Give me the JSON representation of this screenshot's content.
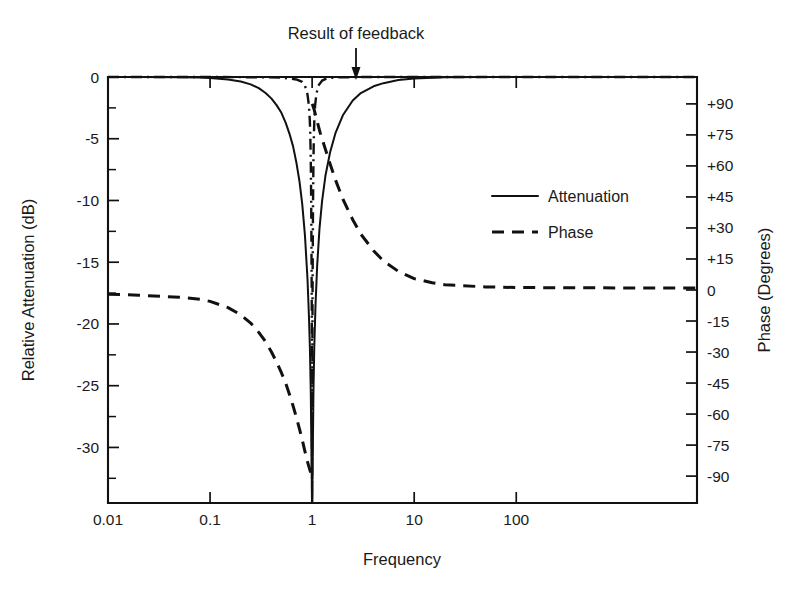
{
  "figure": {
    "annotation": {
      "text": "Result of feedback",
      "points_to": "dash-dot notch curve near f = 1"
    },
    "legend": {
      "entries": [
        {
          "label": "Attenuation",
          "style": "solid"
        },
        {
          "label": "Phase",
          "style": "dashed"
        }
      ]
    }
  },
  "chart_data": {
    "type": "line",
    "title": "",
    "xlabel": "Frequency",
    "ylabel": "Relative Attenuation (dB)",
    "y2label": "Phase (Degrees)",
    "xscale": "log",
    "xlim": [
      0.01,
      5900
    ],
    "ylim": [
      -34.5,
      0
    ],
    "y2lim": [
      -103,
      103
    ],
    "grid": false,
    "legend_position": "center-right",
    "xticks": [
      "0.01",
      "0.1",
      "1",
      "10",
      "100"
    ],
    "xtick_values": [
      0.01,
      0.1,
      1,
      10,
      100
    ],
    "yticks": [
      "0",
      "-5",
      "-10",
      "-15",
      "-20",
      "-25",
      "-30"
    ],
    "ytick_values": [
      0,
      -5,
      -10,
      -15,
      -20,
      -25,
      -30
    ],
    "yticks_minor": [
      -2.5,
      -7.5,
      -12.5,
      -17.5,
      -22.5,
      -27.5,
      -32.5
    ],
    "y2ticks": [
      "+90",
      "+75",
      "+60",
      "+45",
      "+30",
      "+15",
      "0",
      "-15",
      "-30",
      "-45",
      "-60",
      "-75",
      "-90"
    ],
    "y2tick_values": [
      90,
      75,
      60,
      45,
      30,
      15,
      0,
      -15,
      -30,
      -45,
      -60,
      -75,
      -90
    ],
    "series": [
      {
        "name": "Attenuation",
        "style": "solid",
        "axis": "left",
        "units": "dB",
        "description": "Notch filter response, null at f = 1, flat 0 dB far from the notch",
        "points": [
          [
            0.01,
            0.0
          ],
          [
            0.02,
            0.0
          ],
          [
            0.05,
            -0.02
          ],
          [
            0.08,
            -0.05
          ],
          [
            0.1,
            -0.09
          ],
          [
            0.15,
            -0.2
          ],
          [
            0.2,
            -0.37
          ],
          [
            0.25,
            -0.6
          ],
          [
            0.3,
            -0.9
          ],
          [
            0.35,
            -1.3
          ],
          [
            0.4,
            -1.75
          ],
          [
            0.45,
            -2.3
          ],
          [
            0.5,
            -2.9
          ],
          [
            0.55,
            -3.7
          ],
          [
            0.6,
            -4.6
          ],
          [
            0.65,
            -5.6
          ],
          [
            0.7,
            -6.9
          ],
          [
            0.75,
            -8.4
          ],
          [
            0.8,
            -10.3
          ],
          [
            0.85,
            -12.8
          ],
          [
            0.9,
            -16.3
          ],
          [
            0.93,
            -19.3
          ],
          [
            0.95,
            -21.8
          ],
          [
            0.97,
            -25.5
          ],
          [
            0.99,
            -32.0
          ],
          [
            1.0,
            -34.5
          ],
          [
            1.01,
            -32.0
          ],
          [
            1.03,
            -25.5
          ],
          [
            1.05,
            -21.8
          ],
          [
            1.08,
            -18.4
          ],
          [
            1.12,
            -15.3
          ],
          [
            1.18,
            -12.3
          ],
          [
            1.25,
            -10.1
          ],
          [
            1.35,
            -8.0
          ],
          [
            1.5,
            -6.1
          ],
          [
            1.7,
            -4.5
          ],
          [
            2.0,
            -3.1
          ],
          [
            2.5,
            -1.9
          ],
          [
            3.0,
            -1.3
          ],
          [
            4.0,
            -0.75
          ],
          [
            5.0,
            -0.5
          ],
          [
            7.0,
            -0.25
          ],
          [
            10,
            -0.12
          ],
          [
            20,
            -0.03
          ],
          [
            50,
            -0.01
          ],
          [
            100,
            0.0
          ],
          [
            1000,
            0.0
          ],
          [
            5900,
            0.0
          ]
        ]
      },
      {
        "name": "Phase",
        "style": "dashed",
        "axis": "right",
        "units": "degrees",
        "description": "Phase swings from near 0 deg at low frequency to -90 deg just below f = 1, jumps to +90 deg just above f = 1, and returns to 0 deg at high frequency",
        "points_low": [
          [
            0.01,
            -2.0
          ],
          [
            0.02,
            -2.5
          ],
          [
            0.05,
            -3.5
          ],
          [
            0.08,
            -4.5
          ],
          [
            0.1,
            -5.5
          ],
          [
            0.15,
            -8.5
          ],
          [
            0.2,
            -12.0
          ],
          [
            0.25,
            -16.0
          ],
          [
            0.3,
            -20.5
          ],
          [
            0.35,
            -25.0
          ],
          [
            0.4,
            -30.0
          ],
          [
            0.45,
            -35.0
          ],
          [
            0.5,
            -40.0
          ],
          [
            0.55,
            -45.0
          ],
          [
            0.6,
            -50.5
          ],
          [
            0.65,
            -56.0
          ],
          [
            0.7,
            -61.5
          ],
          [
            0.75,
            -67.0
          ],
          [
            0.8,
            -72.5
          ],
          [
            0.85,
            -78.0
          ],
          [
            0.9,
            -83.0
          ],
          [
            0.95,
            -87.0
          ],
          [
            0.98,
            -89.0
          ],
          [
            1.0,
            -90.0
          ]
        ],
        "points_high": [
          [
            1.0,
            90.0
          ],
          [
            1.02,
            89.0
          ],
          [
            1.05,
            87.0
          ],
          [
            1.1,
            83.0
          ],
          [
            1.2,
            76.0
          ],
          [
            1.35,
            68.0
          ],
          [
            1.5,
            61.0
          ],
          [
            1.7,
            53.0
          ],
          [
            2.0,
            44.0
          ],
          [
            2.5,
            34.0
          ],
          [
            3.0,
            27.0
          ],
          [
            4.0,
            19.0
          ],
          [
            5.0,
            14.0
          ],
          [
            7.0,
            9.0
          ],
          [
            10,
            5.5
          ],
          [
            15,
            3.5
          ],
          [
            20,
            2.5
          ],
          [
            50,
            1.5
          ],
          [
            100,
            1.2
          ],
          [
            1000,
            1.0
          ],
          [
            5900,
            1.0
          ]
        ]
      },
      {
        "name": "Result of feedback",
        "style": "dash-dot",
        "axis": "left",
        "units": "dB",
        "description": "Sharpened (high-Q) notch produced by feedback; much narrower skirts than the plain notch",
        "points": [
          [
            0.01,
            0.0
          ],
          [
            0.1,
            0.0
          ],
          [
            0.3,
            -0.02
          ],
          [
            0.5,
            -0.05
          ],
          [
            0.7,
            -0.2
          ],
          [
            0.8,
            -0.4
          ],
          [
            0.85,
            -0.7
          ],
          [
            0.9,
            -1.4
          ],
          [
            0.93,
            -2.3
          ],
          [
            0.95,
            -3.6
          ],
          [
            0.96,
            -4.8
          ],
          [
            0.97,
            -6.8
          ],
          [
            0.98,
            -10.5
          ],
          [
            0.99,
            -17.0
          ],
          [
            0.995,
            -23.0
          ],
          [
            1.0,
            -34.5
          ],
          [
            1.005,
            -23.0
          ],
          [
            1.01,
            -17.0
          ],
          [
            1.02,
            -10.5
          ],
          [
            1.03,
            -6.8
          ],
          [
            1.04,
            -4.8
          ],
          [
            1.05,
            -3.6
          ],
          [
            1.07,
            -2.3
          ],
          [
            1.1,
            -1.4
          ],
          [
            1.15,
            -0.7
          ],
          [
            1.25,
            -0.3
          ],
          [
            1.4,
            -0.1
          ],
          [
            1.8,
            -0.03
          ],
          [
            3.0,
            0.0
          ],
          [
            10,
            0.0
          ],
          [
            100,
            0.0
          ],
          [
            5900,
            0.0
          ]
        ]
      }
    ]
  }
}
